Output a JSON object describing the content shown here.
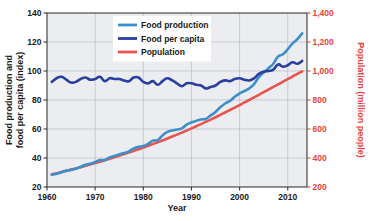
{
  "chart_data": {
    "type": "line",
    "title": "",
    "xlabel": "Year",
    "ylabel": "Food production and food per capita (index)",
    "ylabel_right": "Population (million people)",
    "xlim": [
      1960,
      2014
    ],
    "ylim": [
      20,
      140
    ],
    "ylim_right": [
      200,
      1400
    ],
    "xticks": [
      1960,
      1970,
      1980,
      1990,
      2000,
      2010
    ],
    "xticklabels": [
      "1960",
      "1970",
      "1980",
      "1990",
      "2000",
      "2010"
    ],
    "yticks": [
      20,
      40,
      60,
      80,
      100,
      120,
      140
    ],
    "yticklabels": [
      "20",
      "40",
      "60",
      "80",
      "100",
      "120",
      "140"
    ],
    "yticks_right": [
      200,
      400,
      600,
      800,
      1000,
      1200,
      1400
    ],
    "yticklabels_right": [
      "200",
      "400",
      "600",
      "800",
      "1,000",
      "1,200",
      "1,400"
    ],
    "grid": true,
    "legend_position": "top-center",
    "plot_background": "#ebedf1",
    "colors": {
      "food_production": "#3d8fc9",
      "food_per_capita": "#2b3f9e",
      "population": "#e8554e",
      "right_axis": "#e8433c",
      "grid": "#b9bcc4",
      "axis": "#3a3a3a"
    },
    "x": [
      1961,
      1962,
      1963,
      1964,
      1965,
      1966,
      1967,
      1968,
      1969,
      1970,
      1971,
      1972,
      1973,
      1974,
      1975,
      1976,
      1977,
      1978,
      1979,
      1980,
      1981,
      1982,
      1983,
      1984,
      1985,
      1986,
      1987,
      1988,
      1989,
      1990,
      1991,
      1992,
      1993,
      1994,
      1995,
      1996,
      1997,
      1998,
      1999,
      2000,
      2001,
      2002,
      2003,
      2004,
      2005,
      2006,
      2007,
      2008,
      2009,
      2010,
      2011,
      2012,
      2013
    ],
    "series": [
      {
        "name": "Food production",
        "axis": "left",
        "color": "#3d8fc9",
        "values": [
          28.5,
          29.2,
          30.2,
          31.3,
          31.8,
          32.6,
          34.0,
          35.3,
          36.0,
          37.2,
          38.6,
          38.6,
          40.4,
          41.4,
          42.5,
          43.4,
          44.6,
          46.6,
          47.8,
          48.2,
          49.8,
          52.0,
          52.4,
          55.6,
          58.0,
          59.0,
          59.6,
          60.4,
          63.0,
          64.6,
          65.6,
          66.6,
          67.0,
          69.4,
          71.8,
          75.0,
          77.6,
          79.4,
          82.2,
          84.6,
          86.2,
          88.0,
          91.0,
          95.8,
          99.0,
          102.0,
          105.0,
          110.0,
          111.5,
          115.0,
          119.0,
          122.0,
          126.0
        ]
      },
      {
        "name": "Food per capita",
        "axis": "left",
        "color": "#2b3f9e",
        "values": [
          92.5,
          95.0,
          96.0,
          94.0,
          92.0,
          92.5,
          94.5,
          95.5,
          94.0,
          94.5,
          96.0,
          93.0,
          95.0,
          94.5,
          94.5,
          93.5,
          93.0,
          95.5,
          95.5,
          92.5,
          91.5,
          93.0,
          90.5,
          93.0,
          95.0,
          93.5,
          91.5,
          89.5,
          91.5,
          91.5,
          90.5,
          90.0,
          88.0,
          89.0,
          90.0,
          92.5,
          93.5,
          93.0,
          94.5,
          95.0,
          94.0,
          93.5,
          95.0,
          98.0,
          99.5,
          100.0,
          101.0,
          104.5,
          103.0,
          104.0,
          106.0,
          105.0,
          107.0
        ]
      },
      {
        "name": "Population",
        "axis": "right",
        "color": "#e8554e",
        "values": [
          288,
          295,
          303,
          311,
          320,
          328,
          337,
          346,
          356,
          365,
          375,
          385,
          395,
          405,
          416,
          427,
          438,
          449,
          460,
          472,
          484,
          496,
          509,
          521,
          534,
          548,
          561,
          575,
          589,
          604,
          619,
          634,
          649,
          665,
          681,
          698,
          714,
          731,
          748,
          765,
          783,
          800,
          818,
          836,
          854,
          872,
          890,
          908,
          926,
          944,
          962,
          980,
          998
        ]
      }
    ],
    "legend": [
      {
        "label": "Food production",
        "color": "#3d8fc9"
      },
      {
        "label": "Food per capita",
        "color": "#2b3f9e"
      },
      {
        "label": "Population",
        "color": "#e8554e"
      }
    ]
  }
}
